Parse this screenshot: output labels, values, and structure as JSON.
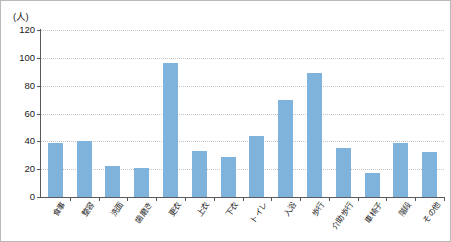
{
  "chart": {
    "unit_label": "(人)",
    "bar_color": "#7FB3DC",
    "axis_color": "#59595B",
    "grid_color": "#C4C4C4"
  },
  "chart_data": {
    "type": "bar",
    "title": "",
    "subtitle": "",
    "xlabel": "",
    "ylabel": "(人)",
    "ylim": [
      0,
      120
    ],
    "yticks": [
      0,
      20,
      40,
      60,
      80,
      100,
      120
    ],
    "grid": true,
    "legend": false,
    "categories": [
      "食事",
      "整容",
      "洗面",
      "歯磨き",
      "更衣",
      "上衣",
      "下衣",
      "トイレ",
      "入浴",
      "歩行",
      "介助歩行",
      "車椅子",
      "階段",
      "その他"
    ],
    "values": [
      39,
      40,
      22,
      21,
      96,
      33,
      29,
      44,
      70,
      89,
      35,
      17,
      39,
      32
    ]
  }
}
